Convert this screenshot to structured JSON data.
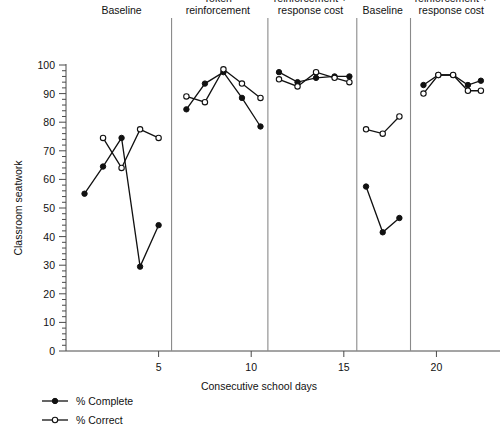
{
  "chart_data": {
    "type": "line",
    "title": "",
    "xlabel": "Consecutive school days",
    "ylabel": "Classroom seatwork",
    "xlim": [
      0,
      23
    ],
    "ylim": [
      0,
      100
    ],
    "ytick_values": [
      0,
      10,
      20,
      30,
      40,
      50,
      60,
      70,
      80,
      90,
      100
    ],
    "ytick_labels": [
      "0",
      "10",
      "20",
      "30",
      "40",
      "50",
      "60",
      "70",
      "80",
      "90",
      "100"
    ],
    "yminor_step": 2,
    "xtick_values": [
      5,
      10,
      15,
      20
    ],
    "xtick_labels": [
      "5",
      "10",
      "15",
      "20"
    ],
    "grid": false,
    "legend_position": "below-left",
    "legend": [
      {
        "name": "% Complete",
        "marker": "filled-circle"
      },
      {
        "name": "% Correct",
        "marker": "open-circle"
      }
    ],
    "phase_dividers_x": [
      5.7,
      10.9,
      15.7,
      18.6
    ],
    "phases": [
      {
        "label": "Baseline",
        "label_lines": [
          "Baseline"
        ],
        "x_center": 3.0
      },
      {
        "label": "Token reinforcement",
        "label_lines": [
          "Token",
          "reinforcement"
        ],
        "x_center": 8.2
      },
      {
        "label": "Token reinforcement + response cost",
        "label_lines": [
          "Token",
          "reinforcement +",
          "response cost"
        ],
        "x_center": 13.2
      },
      {
        "label": "Baseline",
        "label_lines": [
          "Baseline"
        ],
        "x_center": 17.1
      },
      {
        "label": "Token reinforcement + response cost",
        "label_lines": [
          "Token",
          "reinforcement +",
          "response cost"
        ],
        "x_center": 20.8
      }
    ],
    "series": [
      {
        "name": "% Complete",
        "marker": "filled-circle",
        "segments": [
          {
            "x": [
              1,
              2,
              3,
              4,
              5
            ],
            "y": [
              55,
              64.5,
              74.5,
              29.5,
              44
            ]
          },
          {
            "x": [
              6.5,
              7.5,
              8.5,
              9.5,
              10.5
            ],
            "y": [
              84.5,
              93.5,
              97.5,
              88.5,
              78.5
            ]
          },
          {
            "x": [
              11.5,
              12.5,
              13.5,
              14.5,
              15.3
            ],
            "y": [
              97.5,
              94,
              95.5,
              96,
              96
            ]
          },
          {
            "x": [
              16.2,
              17.1,
              18.0
            ],
            "y": [
              57.5,
              41.5,
              46.5
            ]
          },
          {
            "x": [
              19.3,
              20.1,
              20.9,
              21.7,
              22.4
            ],
            "y": [
              93,
              96.5,
              96.5,
              93,
              94.5
            ]
          }
        ]
      },
      {
        "name": "% Correct",
        "marker": "open-circle",
        "segments": [
          {
            "x": [
              2,
              3,
              4
            ],
            "y": [
              74.5,
              64,
              77.5
            ],
            "extra_x": [
              5
            ],
            "extra_y": [
              74.5
            ]
          },
          {
            "x": [
              6.5,
              7.5,
              8.5,
              9.5,
              10.5
            ],
            "y": [
              89,
              87,
              98.5,
              93.5,
              88.5
            ]
          },
          {
            "x": [
              11.5,
              12.5,
              13.5,
              14.5,
              15.3
            ],
            "y": [
              95,
              92.5,
              97.5,
              95.5,
              94
            ]
          },
          {
            "x": [
              16.2,
              17.1,
              18.0
            ],
            "y": [
              77.5,
              76,
              82
            ]
          },
          {
            "x": [
              19.3,
              20.1,
              20.9,
              21.7,
              22.4
            ],
            "y": [
              90,
              96.5,
              96.5,
              91,
              91
            ]
          }
        ]
      }
    ]
  },
  "axis": {
    "y_title": "Classroom seatwork",
    "x_title": "Consecutive school days"
  },
  "legend_items": [
    {
      "label": "% Complete"
    },
    {
      "label": "% Correct"
    }
  ]
}
